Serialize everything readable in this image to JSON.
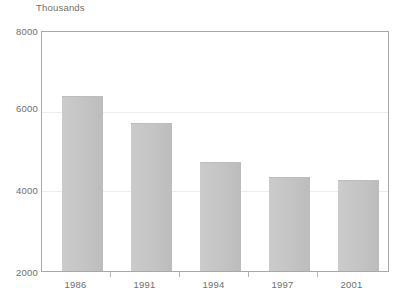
{
  "chart_data": {
    "type": "bar",
    "title": "",
    "subtitle": "",
    "unit_label": "Thousands",
    "xlabel": "",
    "ylabel": "Thousands",
    "categories": [
      "1986",
      "1991",
      "1994",
      "1997",
      "2001"
    ],
    "values": [
      6390,
      5720,
      4740,
      4350,
      4280
    ],
    "series": [
      {
        "name": "Value",
        "values": [
          6390,
          5720,
          4740,
          4350,
          4280
        ]
      }
    ],
    "ylim": [
      2000,
      8000
    ],
    "y_ticks": [
      "2000",
      "4000",
      "6000",
      "8000"
    ],
    "y_tick_values": [
      2000,
      4000,
      6000,
      8000
    ],
    "grid": true,
    "legend": false,
    "legend_position": "none",
    "bar_color": "#c4c4c4",
    "axis_color": "#a8a8a8",
    "text_color": "#6e6e6e",
    "grid_color": "#ececec"
  }
}
